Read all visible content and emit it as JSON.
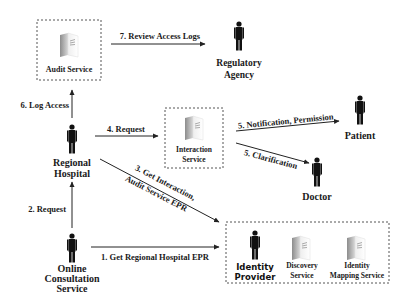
{
  "diagram": {
    "nodes": {
      "audit_service": {
        "label": "Audit Service",
        "type": "service"
      },
      "regulatory_agency": {
        "label_line1": "Regulatory",
        "label_line2": "Agency",
        "type": "actor"
      },
      "regional_hospital": {
        "label_line1": "Regional",
        "label_line2": "Hospital",
        "type": "actor"
      },
      "interaction_service": {
        "label_line1": "Interaction",
        "label_line2": "Service",
        "type": "service"
      },
      "patient": {
        "label": "Patient",
        "type": "actor"
      },
      "doctor": {
        "label": "Doctor",
        "type": "actor"
      },
      "online_consultation": {
        "label_line1": "Online",
        "label_line2": "Consultation",
        "label_line3": "Service",
        "type": "actor"
      },
      "identity_provider": {
        "label_line1": "Identity",
        "label_line2": "Provider",
        "type": "actor"
      },
      "discovery_service": {
        "label_line1": "Discovery",
        "label_line2": "Service",
        "type": "service"
      },
      "identity_mapping_service": {
        "label_line1": "Identity",
        "label_line2": "Mapping Service",
        "type": "service"
      }
    },
    "edges": {
      "e1": "1. Get Regional Hospital EPR",
      "e2": "2. Request",
      "e3_line1": "3. Get Interaction,",
      "e3_line2": "Audit Service EPR",
      "e4": "4. Request",
      "e5a": "5. Notification, Permission",
      "e5b": "5. Clarification",
      "e6": "6. Log Access",
      "e7": "7. Review Access Logs"
    }
  }
}
